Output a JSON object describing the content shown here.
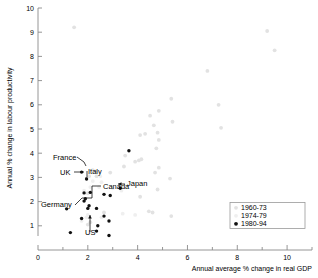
{
  "chart_data": {
    "type": "scatter",
    "title": "",
    "xlabel": "Annual average % change in real GDP",
    "ylabel": "Annual % change in labour productivity",
    "xlim": [
      0,
      11
    ],
    "ylim": [
      0,
      10
    ],
    "xticks": [
      0,
      2,
      4,
      6,
      8,
      10
    ],
    "yticks": [
      1,
      2,
      3,
      4,
      5,
      6,
      7,
      8,
      9,
      10
    ],
    "xtick_labels": [
      "0",
      "2",
      "4",
      "6",
      "8",
      "10"
    ],
    "ytick_labels": [
      "1",
      "2",
      "3",
      "4",
      "5",
      "6",
      "7",
      "8",
      "9",
      "10"
    ],
    "grid": false,
    "legend_position": "lower-right",
    "series": [
      {
        "name": "1960-73",
        "color": "#e2e2e2",
        "marker": "circle",
        "points": [
          [
            9.2,
            9.05
          ],
          [
            9.5,
            8.25
          ],
          [
            6.8,
            7.4
          ],
          [
            7.25,
            6.0
          ],
          [
            7.35,
            5.05
          ],
          [
            5.35,
            6.25
          ],
          [
            5.4,
            5.3
          ],
          [
            4.85,
            5.75
          ],
          [
            4.8,
            4.85
          ],
          [
            4.85,
            4.55
          ],
          [
            4.75,
            4.2
          ],
          [
            4.65,
            5.15
          ],
          [
            4.5,
            5.55
          ],
          [
            4.3,
            4.8
          ],
          [
            4.1,
            4.75
          ],
          [
            5.3,
            2.95
          ],
          [
            4.85,
            3.4
          ],
          [
            4.7,
            3.2
          ],
          [
            4.15,
            3.75
          ],
          [
            4.05,
            3.7
          ],
          [
            3.9,
            3.65
          ],
          [
            3.5,
            3.9
          ],
          [
            3.45,
            3.45
          ],
          [
            4.8,
            2.5
          ],
          [
            4.1,
            2.2
          ],
          [
            1.45,
            9.2
          ],
          [
            2.0,
            2.35
          ],
          [
            2.2,
            3.3
          ],
          [
            2.3,
            3.25
          ],
          [
            2.35,
            3.05
          ],
          [
            2.05,
            3.05
          ],
          [
            2.9,
            3.2
          ],
          [
            4.45,
            1.6
          ],
          [
            4.6,
            1.55
          ],
          [
            5.35,
            1.4
          ],
          [
            2.65,
            1.55
          ],
          [
            2.1,
            1.15
          ],
          [
            2.0,
            1.05
          ]
        ]
      },
      {
        "name": "1974-79",
        "color": "#efefef",
        "marker": "circle",
        "points": [
          [
            2.1,
            2.6
          ],
          [
            1.85,
            2.45
          ],
          [
            2.2,
            2.85
          ],
          [
            2.5,
            3.05
          ],
          [
            2.55,
            2.8
          ],
          [
            2.45,
            2.6
          ],
          [
            3.0,
            2.55
          ],
          [
            3.35,
            2.45
          ],
          [
            1.95,
            1.35
          ],
          [
            2.0,
            1.45
          ],
          [
            1.75,
            1.2
          ],
          [
            2.55,
            1.35
          ],
          [
            3.4,
            1.5
          ],
          [
            3.9,
            1.45
          ]
        ]
      },
      {
        "name": "1980-94",
        "color": "#111111",
        "marker": "circle",
        "points": [
          [
            1.75,
            3.22
          ],
          [
            1.95,
            2.93
          ],
          [
            1.85,
            2.36
          ],
          [
            2.1,
            2.38
          ],
          [
            1.9,
            2.12
          ],
          [
            1.85,
            2.02
          ],
          [
            2.05,
            1.83
          ],
          [
            2.0,
            1.72
          ],
          [
            1.15,
            1.7
          ],
          [
            1.75,
            1.3
          ],
          [
            1.3,
            0.72
          ],
          [
            2.35,
            1.72
          ],
          [
            2.4,
            1.0
          ],
          [
            2.35,
            0.78
          ],
          [
            2.65,
            1.4
          ],
          [
            2.85,
            1.2
          ],
          [
            2.85,
            0.6
          ],
          [
            2.9,
            2.25
          ],
          [
            2.65,
            2.3
          ],
          [
            3.3,
            2.55
          ],
          [
            3.65,
            4.1
          ]
        ]
      }
    ],
    "annotations": [
      {
        "text": "France",
        "label_x": 53,
        "label_y": 160
      },
      {
        "text": "UK",
        "label_x": 60,
        "label_y": 175
      },
      {
        "text": "Italy",
        "label_x": 88,
        "label_y": 174
      },
      {
        "text": "Germany",
        "label_x": 41,
        "label_y": 207
      },
      {
        "text": "Canada",
        "label_x": 103,
        "label_y": 189
      },
      {
        "text": "US",
        "label_x": 85,
        "label_y": 235
      },
      {
        "text": "Japan",
        "label_x": 127,
        "label_y": 186
      }
    ]
  },
  "legend": {
    "items": [
      {
        "label": "1960-73",
        "color": "#e2e2e2"
      },
      {
        "label": "1974-79",
        "color": "#efefef"
      },
      {
        "label": "1980-94",
        "color": "#111111"
      }
    ]
  }
}
